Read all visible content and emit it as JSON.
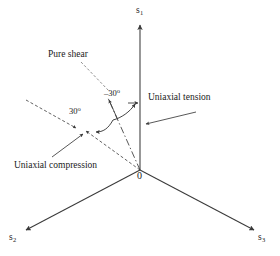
{
  "figure": {
    "type": "principal-stress-space-diagram",
    "background_color": "#ffffff",
    "line_color": "#3a3a3a",
    "text_color": "#1a1a1a",
    "axes": [
      {
        "name": "sigma-1-axis",
        "label": "s",
        "subscript": "1",
        "direction": "up",
        "origin": [
          140,
          170
        ],
        "tip": [
          140,
          22
        ]
      },
      {
        "name": "sigma-2-axis",
        "label": "s",
        "subscript": "2",
        "direction": "lower-left",
        "origin": [
          140,
          170
        ],
        "tip": [
          22,
          232
        ]
      },
      {
        "name": "sigma-3-axis",
        "label": "s",
        "subscript": "3",
        "direction": "lower-right",
        "origin": [
          140,
          170
        ],
        "tip": [
          258,
          232
        ]
      }
    ],
    "origin_label": "0",
    "annotations": [
      {
        "name": "pure-shear",
        "label": "Pure shear"
      },
      {
        "name": "uniaxial-tension",
        "label": "Uniaxial tension"
      },
      {
        "name": "uniaxial-compression",
        "label": "Uniaxial compression"
      }
    ],
    "angles": [
      {
        "name": "angle-positive-30",
        "value": "30",
        "unit": "o",
        "label": "30o"
      },
      {
        "name": "angle-negative-30",
        "value": "-30",
        "unit": "o",
        "label": "-30o"
      }
    ]
  },
  "labels": {
    "s1_base": "s",
    "s1_sub": "1",
    "s2_base": "s",
    "s2_sub": "2",
    "s3_base": "s",
    "s3_sub": "3",
    "origin": "0",
    "pure_shear": "Pure shear",
    "uniaxial_tension": "Uniaxial tension",
    "uniaxial_compression": "Uniaxial compression",
    "angle_pos": "30",
    "angle_neg": "–30",
    "degree": "o"
  }
}
